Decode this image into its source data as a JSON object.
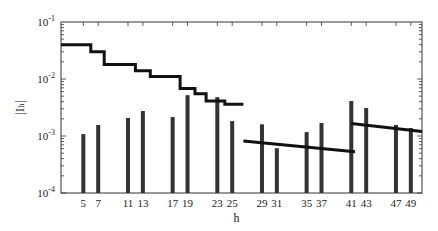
{
  "chart_data": {
    "type": "bar",
    "title": "",
    "xlabel": "h",
    "ylabel": "|I_h|",
    "yscale": "log",
    "ylim": [
      0.0001,
      0.1
    ],
    "xlim": [
      2,
      50.5
    ],
    "grid": false,
    "legend": null,
    "y_tick_labels": [
      "10^-4",
      "10^-3",
      "10^-2",
      "10^-1"
    ],
    "x_tick_labels": [
      "5",
      "7",
      "11",
      "13",
      "17",
      "19",
      "23",
      "25",
      "29",
      "31",
      "35",
      "37",
      "41",
      "43",
      "47",
      "49"
    ],
    "categories": [
      5,
      7,
      11,
      13,
      17,
      19,
      23,
      25,
      29,
      31,
      35,
      37,
      41,
      43,
      47,
      49
    ],
    "series": [
      {
        "name": "Harmonic current magnitude |I_h|",
        "type": "bar",
        "values": [
          0.00108,
          0.00156,
          0.00207,
          0.00274,
          0.00215,
          0.0052,
          0.0048,
          0.00183,
          0.0016,
          0.00061,
          0.00117,
          0.00169,
          0.0041,
          0.0031,
          0.00156,
          0.00138
        ]
      },
      {
        "name": "Limit (stepped, h 2-25)",
        "type": "step",
        "points": [
          [
            2,
            0.04
          ],
          [
            6,
            0.04
          ],
          [
            6,
            0.03
          ],
          [
            7.8,
            0.03
          ],
          [
            7.8,
            0.018
          ],
          [
            12,
            0.018
          ],
          [
            12,
            0.014
          ],
          [
            14,
            0.014
          ],
          [
            14,
            0.011
          ],
          [
            18,
            0.011
          ],
          [
            18,
            0.0068
          ],
          [
            20,
            0.0068
          ],
          [
            20,
            0.0055
          ],
          [
            21.5,
            0.0055
          ],
          [
            21.5,
            0.0041
          ],
          [
            24,
            0.0041
          ],
          [
            24,
            0.0036
          ],
          [
            26.5,
            0.0036
          ]
        ]
      },
      {
        "name": "Limit (h 26-40)",
        "type": "line",
        "points": [
          [
            26.5,
            0.00082
          ],
          [
            41.5,
            0.00053
          ]
        ]
      },
      {
        "name": "Limit (h 41-50)",
        "type": "line",
        "points": [
          [
            41,
            0.00165
          ],
          [
            50.5,
            0.0012
          ]
        ]
      }
    ]
  }
}
